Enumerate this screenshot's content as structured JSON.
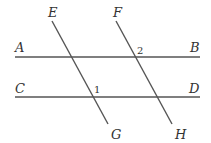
{
  "diagram": {
    "type": "two parallel lines cut by two transversals",
    "lines": [
      {
        "name": "AB",
        "x1": 15,
        "y1": 57,
        "x2": 200,
        "y2": 57
      },
      {
        "name": "CD",
        "x1": 15,
        "y1": 97,
        "x2": 200,
        "y2": 97
      },
      {
        "name": "EG",
        "x1": 52,
        "y1": 21,
        "x2": 108,
        "y2": 124
      },
      {
        "name": "FH",
        "x1": 116,
        "y1": 21,
        "x2": 172,
        "y2": 124
      }
    ],
    "labels": {
      "A": "A",
      "B": "B",
      "C": "C",
      "D": "D",
      "E": "E",
      "F": "F",
      "G": "G",
      "H": "H"
    },
    "angles": {
      "angle1": "1",
      "angle2": "2"
    },
    "color": "#555555"
  }
}
